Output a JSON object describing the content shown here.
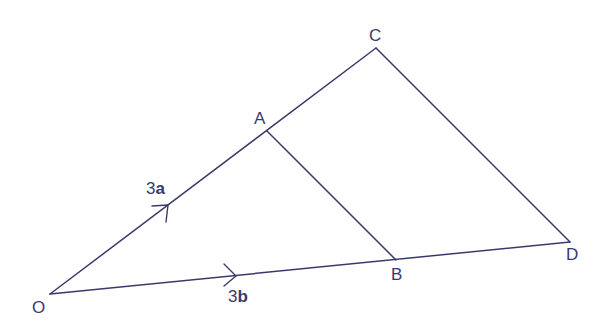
{
  "diagram": {
    "type": "vector-geometry",
    "colors": {
      "line": "#3a3a6a",
      "text": "#3a3a6a",
      "background": "#ffffff"
    },
    "points": {
      "O": {
        "label": "O",
        "x": 50,
        "y": 294
      },
      "A": {
        "label": "A",
        "x": 267,
        "y": 131
      },
      "C": {
        "label": "C",
        "x": 376,
        "y": 48
      },
      "B": {
        "label": "B",
        "x": 396,
        "y": 260
      },
      "D": {
        "label": "D",
        "x": 570,
        "y": 242
      }
    },
    "segments": [
      {
        "from": "O",
        "to": "C"
      },
      {
        "from": "O",
        "to": "D"
      },
      {
        "from": "A",
        "to": "B"
      },
      {
        "from": "C",
        "to": "D"
      }
    ],
    "vectors": [
      {
        "along": "OA",
        "coefficient": "3",
        "symbol": "a",
        "text": "3a"
      },
      {
        "along": "OB",
        "coefficient": "3",
        "symbol": "b",
        "text": "3b"
      }
    ]
  }
}
